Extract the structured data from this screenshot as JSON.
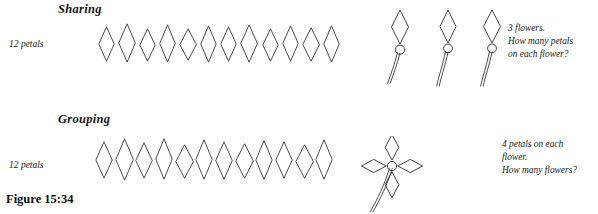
{
  "figure": {
    "caption": "Figure 15:34",
    "background_color": "#ffffff",
    "ink_color": "#2b2b2b"
  },
  "sections": [
    {
      "id": "sharing",
      "title": "Sharing",
      "row_label": "12 petals",
      "petal_count": 12,
      "flower_count": 3,
      "petals_per_flower": 1,
      "note_lines": [
        "3 flowers.",
        "How many petals",
        "on each flower?"
      ]
    },
    {
      "id": "grouping",
      "title": "Grouping",
      "row_label": "12 petals",
      "petal_count": 12,
      "flower_count": 1,
      "petals_per_flower": 4,
      "note_lines": [
        "4 petals on each",
        "flower.",
        "How many flowers?"
      ]
    }
  ],
  "icons": {
    "petal": "diamond-petal-icon",
    "flower_center": "circle-center-icon",
    "stem": "curved-stem-icon"
  },
  "chart_data": {
    "type": "diagram",
    "title": "Figure 15:34",
    "panels": [
      {
        "label": "Sharing",
        "loose_petals": 12,
        "flowers": 3,
        "petals_each": 1,
        "question": "3 flowers. How many petals on each flower?"
      },
      {
        "label": "Grouping",
        "loose_petals": 12,
        "flowers": 1,
        "petals_each": 4,
        "question": "4 petals on each flower. How many flowers?"
      }
    ]
  }
}
